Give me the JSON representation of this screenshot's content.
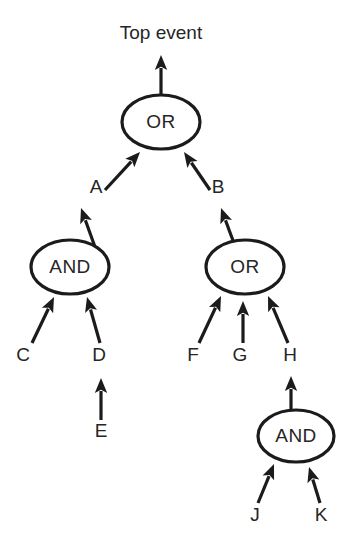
{
  "diagram": {
    "title_text": "Top event",
    "type": "fault-tree",
    "background_color": "#ffffff",
    "stroke_color": "#1b1b1b",
    "text_color": "#262626"
  },
  "gates": [
    {
      "id": "g_top",
      "label": "OR",
      "cx": 161,
      "cy": 122,
      "rx": 39,
      "ry": 27
    },
    {
      "id": "g_and_a",
      "label": "AND",
      "cx": 70,
      "cy": 267,
      "rx": 39,
      "ry": 27
    },
    {
      "id": "g_or_b",
      "label": "OR",
      "cx": 245,
      "cy": 267,
      "rx": 39,
      "ry": 27
    },
    {
      "id": "g_and_h",
      "label": "AND",
      "cx": 296,
      "cy": 436,
      "rx": 38,
      "ry": 26
    }
  ],
  "events": [
    {
      "id": "e_top",
      "label": "Top event",
      "x": 161,
      "y": 34
    },
    {
      "id": "e_a",
      "label": "A",
      "x": 96,
      "y": 188
    },
    {
      "id": "e_b",
      "label": "B",
      "x": 218,
      "y": 188
    },
    {
      "id": "e_c",
      "label": "C",
      "x": 23,
      "y": 356
    },
    {
      "id": "e_d",
      "label": "D",
      "x": 99,
      "y": 356
    },
    {
      "id": "e_e",
      "label": "E",
      "x": 101,
      "y": 432
    },
    {
      "id": "e_f",
      "label": "F",
      "x": 193,
      "y": 356
    },
    {
      "id": "e_g",
      "label": "G",
      "x": 240,
      "y": 356
    },
    {
      "id": "e_h",
      "label": "H",
      "x": 290,
      "y": 356
    },
    {
      "id": "e_j",
      "label": "J",
      "x": 255,
      "y": 516
    },
    {
      "id": "e_k",
      "label": "K",
      "x": 321,
      "y": 516
    }
  ],
  "edges": [
    {
      "id": "edge_top_out",
      "from": "g_top",
      "to": "e_top",
      "x1": 161,
      "y1": 95,
      "x2": 161,
      "y2": 55
    },
    {
      "id": "edge_a_top",
      "from": "e_a",
      "to": "g_top",
      "x1": 105,
      "y1": 190,
      "x2": 140,
      "y2": 152
    },
    {
      "id": "edge_b_top",
      "from": "e_b",
      "to": "g_top",
      "x1": 210,
      "y1": 190,
      "x2": 184,
      "y2": 152
    },
    {
      "id": "edge_and_a",
      "from": "g_and_a",
      "to": "e_a",
      "x1": 95,
      "y1": 247,
      "x2": 81,
      "y2": 208
    },
    {
      "id": "edge_or_b",
      "from": "g_or_b",
      "to": "e_b",
      "x1": 235,
      "y1": 246,
      "x2": 221,
      "y2": 208
    },
    {
      "id": "edge_c_and",
      "from": "e_c",
      "to": "g_and_a",
      "x1": 32,
      "y1": 343,
      "x2": 54,
      "y2": 297
    },
    {
      "id": "edge_d_and",
      "from": "e_d",
      "to": "g_and_a",
      "x1": 100,
      "y1": 343,
      "x2": 87,
      "y2": 297
    },
    {
      "id": "edge_e_d",
      "from": "e_e",
      "to": "e_d",
      "x1": 101,
      "y1": 420,
      "x2": 101,
      "y2": 378
    },
    {
      "id": "edge_f_or",
      "from": "e_f",
      "to": "g_or_b",
      "x1": 199,
      "y1": 343,
      "x2": 221,
      "y2": 296
    },
    {
      "id": "edge_g_or",
      "from": "e_g",
      "to": "g_or_b",
      "x1": 243,
      "y1": 343,
      "x2": 243,
      "y2": 301
    },
    {
      "id": "edge_h_or",
      "from": "e_h",
      "to": "g_or_b",
      "x1": 288,
      "y1": 343,
      "x2": 268,
      "y2": 296
    },
    {
      "id": "edge_and_h",
      "from": "g_and_h",
      "to": "e_h",
      "x1": 291,
      "y1": 414,
      "x2": 291,
      "y2": 376
    },
    {
      "id": "edge_j_and",
      "from": "e_j",
      "to": "g_and_h",
      "x1": 258,
      "y1": 503,
      "x2": 274,
      "y2": 464
    },
    {
      "id": "edge_k_and",
      "from": "e_k",
      "to": "g_and_h",
      "x1": 320,
      "y1": 503,
      "x2": 309,
      "y2": 467
    }
  ]
}
